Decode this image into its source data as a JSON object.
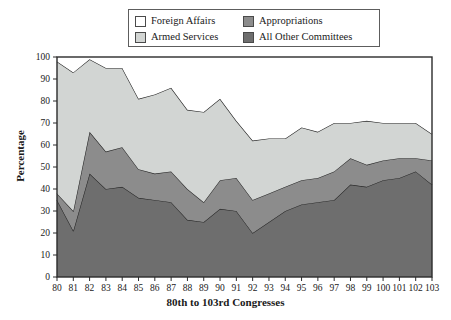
{
  "legend": {
    "items": [
      {
        "label": "Foreign Affairs",
        "color": "#ffffff",
        "key": "foreign_affairs"
      },
      {
        "label": "Appropriations",
        "color": "#8c8c8c",
        "key": "appropriations"
      },
      {
        "label": "Armed Services",
        "color": "#d2d5d3",
        "key": "armed_services"
      },
      {
        "label": "All Other Committees",
        "color": "#6e6e6e",
        "key": "all_other_committees"
      }
    ]
  },
  "chart_data": {
    "type": "area",
    "stacked": true,
    "title": "",
    "xlabel": "80th to 103rd Congresses",
    "ylabel": "Percentage",
    "ylim": [
      0,
      100
    ],
    "yticks": [
      0,
      10,
      20,
      30,
      40,
      50,
      60,
      70,
      80,
      90,
      100
    ],
    "grid": false,
    "legend_position": "top",
    "categories": [
      "80",
      "81",
      "82",
      "83",
      "84",
      "85",
      "86",
      "87",
      "88",
      "89",
      "90",
      "91",
      "92",
      "93",
      "94",
      "95",
      "96",
      "97",
      "98",
      "99",
      "100",
      "101",
      "102",
      "103"
    ],
    "series": [
      {
        "name": "All Other Committees",
        "color": "#6e6e6e",
        "values": [
          35,
          21,
          47,
          40,
          41,
          36,
          35,
          34,
          26,
          25,
          31,
          30,
          20,
          25,
          30,
          33,
          34,
          35,
          42,
          41,
          44,
          45,
          48,
          42
        ]
      },
      {
        "name": "Appropriations",
        "color": "#8c8c8c",
        "values": [
          3,
          9,
          19,
          17,
          18,
          13,
          12,
          14,
          14,
          9,
          13,
          15,
          15,
          13,
          11,
          11,
          11,
          13,
          12,
          10,
          9,
          9,
          6,
          11
        ]
      },
      {
        "name": "Armed Services",
        "color": "#d2d5d3",
        "values": [
          60,
          63,
          33,
          38,
          36,
          32,
          36,
          38,
          36,
          41,
          37,
          26,
          27,
          25,
          22,
          24,
          21,
          22,
          16,
          20,
          17,
          16,
          16,
          12
        ]
      },
      {
        "name": "Foreign Affairs",
        "color": "#ffffff",
        "values": [
          2,
          7,
          1,
          5,
          5,
          19,
          17,
          14,
          24,
          25,
          19,
          29,
          38,
          37,
          37,
          32,
          34,
          30,
          30,
          29,
          30,
          30,
          30,
          35
        ]
      }
    ],
    "cumulative_tops": {
      "all_other_committees": [
        35,
        21,
        47,
        40,
        41,
        36,
        35,
        34,
        26,
        25,
        31,
        30,
        20,
        25,
        30,
        33,
        34,
        35,
        42,
        41,
        44,
        45,
        48,
        42
      ],
      "appropriations": [
        38,
        30,
        66,
        57,
        59,
        49,
        47,
        48,
        40,
        34,
        44,
        45,
        35,
        38,
        41,
        44,
        45,
        48,
        54,
        51,
        53,
        54,
        54,
        53
      ],
      "armed_services": [
        98,
        93,
        99,
        95,
        95,
        81,
        83,
        86,
        76,
        75,
        81,
        71,
        62,
        63,
        63,
        68,
        66,
        70,
        70,
        71,
        70,
        70,
        70,
        65
      ],
      "total": [
        100,
        100,
        100,
        100,
        100,
        100,
        100,
        100,
        100,
        100,
        100,
        100,
        100,
        100,
        100,
        100,
        100,
        100,
        100,
        100,
        100,
        100,
        100,
        100
      ]
    }
  },
  "plot_geometry": {
    "left_px": 57,
    "right_px": 432,
    "top_px": 57,
    "bottom_px": 277
  }
}
